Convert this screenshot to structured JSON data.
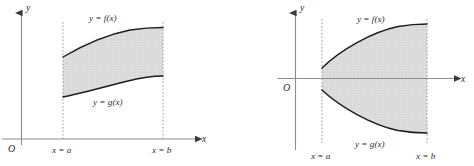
{
  "figure": {
    "background_color": "#ffffff",
    "shading_color": "#d8d8d8",
    "shading_pattern": "fine cross-hatch grid",
    "curve_color": "#1c1c1c",
    "axis_color": "#8d8d8d",
    "dash_color": "#9a9a9a",
    "label_color": "#2e2e2e"
  },
  "panels": [
    {
      "id": "left-panel",
      "name": "region-above-x-axis",
      "labels": {
        "y_axis": "y",
        "x_axis": "x",
        "origin": "O",
        "upper_curve": "y = f(x)",
        "lower_curve": "y = g(x)",
        "left_bound": "x = a",
        "right_bound": "x = b"
      }
    },
    {
      "id": "right-panel",
      "name": "region-straddling-x-axis",
      "labels": {
        "y_axis": "y",
        "x_axis": "x",
        "origin": "O",
        "upper_curve": "y = f(x)",
        "lower_curve": "y = g(x)",
        "left_bound": "x = a",
        "right_bound": "x = b"
      }
    }
  ]
}
